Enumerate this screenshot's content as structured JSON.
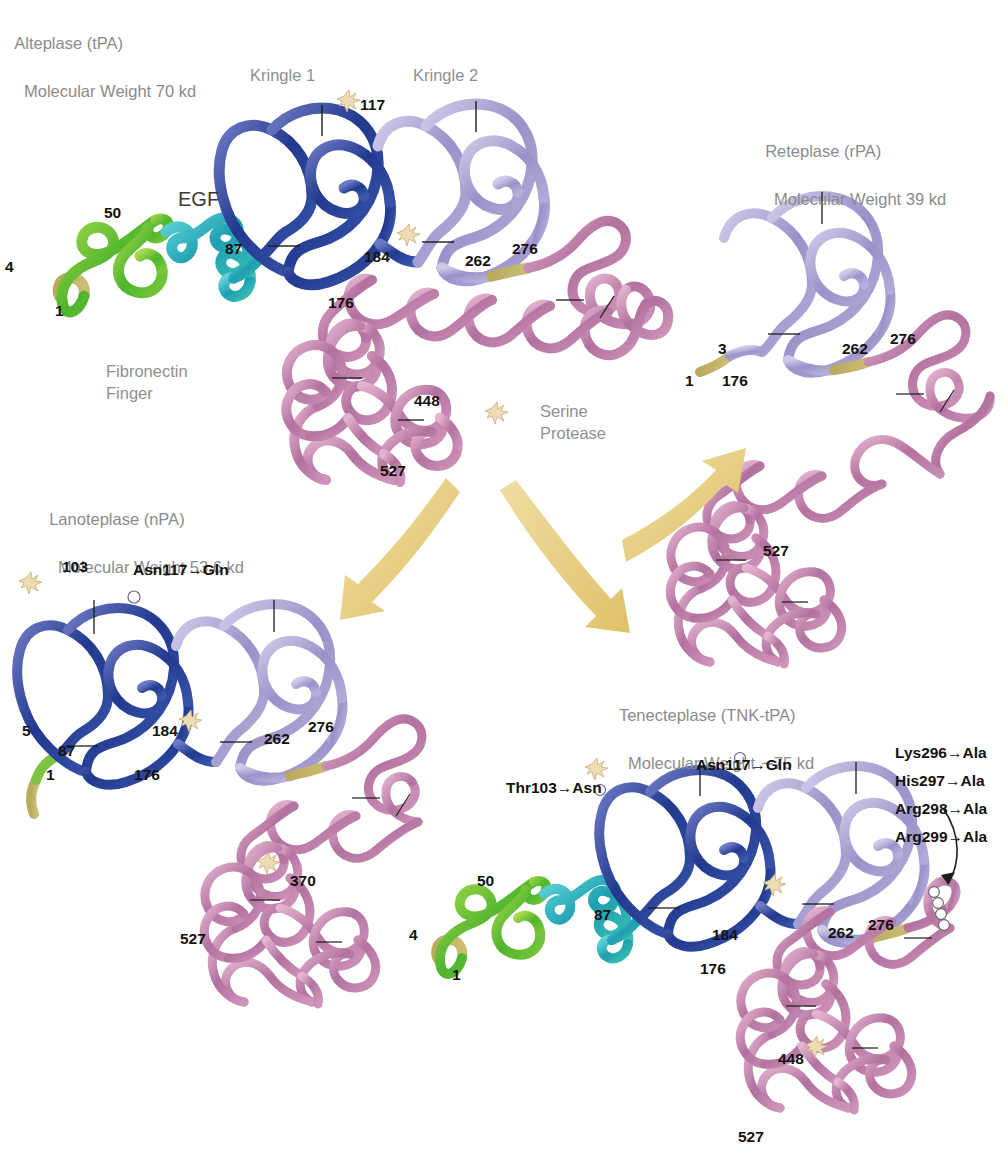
{
  "figure": {
    "type": "molecular-structure-diagram",
    "background_color": "#ffffff"
  },
  "palette": {
    "fibronectin_finger": "#62b838",
    "egf": "#28b0bd",
    "kringle1": "#2a4a9c",
    "kringle2": "#a9a0d2",
    "serine_protease": "#c88fb4",
    "linker_khaki": "#b9a martyr",
    "glycosylation": "#e8d2a8",
    "arrow": "#e9cf86",
    "title_text": "#8b8b8b",
    "label_text": "#15110f"
  },
  "panels": [
    {
      "id": "alteplase",
      "title_line1": "Alteplase (tPA)",
      "title_line2": "Molecular Weight 70 kd",
      "domain_labels": [
        {
          "name": "kringle1",
          "text": "Kringle 1"
        },
        {
          "name": "kringle2",
          "text": "Kringle 2"
        },
        {
          "name": "egf",
          "text": "EGF"
        },
        {
          "name": "fibronectin",
          "text": "Fibronectin\nFinger"
        },
        {
          "name": "serine-protease",
          "text": "Serine\nProtease"
        }
      ],
      "residues": [
        "1",
        "4",
        "50",
        "87",
        "117",
        "176",
        "184",
        "262",
        "276",
        "448",
        "527"
      ],
      "mutations": [],
      "glycosylation_sites": [
        "117",
        "184",
        "448"
      ]
    },
    {
      "id": "reteplase",
      "title_line1": "Reteplase (rPA)",
      "title_line2": "Molecular Weight 39 kd",
      "domain_labels": [],
      "residues": [
        "1",
        "3",
        "176",
        "262",
        "276",
        "527"
      ],
      "mutations": [],
      "glycosylation_sites": []
    },
    {
      "id": "lanoteplase",
      "title_line1": "Lanoteplase (nPA)",
      "title_line2": "Molecular Weight 53.6 kd",
      "domain_labels": [],
      "residues": [
        "1",
        "5",
        "87",
        "103",
        "176",
        "184",
        "262",
        "276",
        "370",
        "527"
      ],
      "mutations": [
        "Asn117→Gln"
      ],
      "glycosylation_sites": [
        "103",
        "184",
        "370"
      ]
    },
    {
      "id": "tenecteplase",
      "title_line1": "Tenecteplase (TNK-tPA)",
      "title_line2": "Molecular Weight ∼75 kd",
      "domain_labels": [],
      "residues": [
        "1",
        "4",
        "50",
        "87",
        "176",
        "184",
        "262",
        "276",
        "448",
        "527"
      ],
      "mutations": [
        "Thr103→Asn",
        "Asn117→Gln",
        "Lys296→Ala",
        "His297→Ala",
        "Arg298→Ala",
        "Arg299→Ala"
      ],
      "glycosylation_sites": [
        "103",
        "184",
        "448"
      ]
    }
  ],
  "arrows": [
    {
      "name": "arrow-to-reteplase",
      "from": "alteplase",
      "to": "reteplase"
    },
    {
      "name": "arrow-to-lanoteplase",
      "from": "alteplase",
      "to": "lanoteplase"
    },
    {
      "name": "arrow-to-tenecteplase",
      "from": "alteplase",
      "to": "tenecteplase"
    },
    {
      "name": "arrow-to-tnk-site",
      "from": "tnk-mutation-list",
      "to": "tenecteplase-296-299-site"
    }
  ],
  "alteplase": {
    "title1": "Alteplase (tPA)",
    "title2": "Molecular Weight 70 kd",
    "kringle1": "Kringle 1",
    "kringle2": "Kringle 2",
    "egf": "EGF",
    "fib1": "Fibronectin",
    "fib2": "Finger",
    "sp1": "Serine",
    "sp2": "Protease",
    "n1": "1",
    "n4": "4",
    "n50": "50",
    "n87": "87",
    "n117": "117",
    "n176": "176",
    "n184": "184",
    "n262": "262",
    "n276": "276",
    "n448": "448",
    "n527": "527"
  },
  "reteplase": {
    "title1": "Reteplase (rPA)",
    "title2": "Molecular Weight 39 kd",
    "n1": "1",
    "n3": "3",
    "n176": "176",
    "n262": "262",
    "n276": "276",
    "n527": "527"
  },
  "lanoteplase": {
    "title1": "Lanoteplase (nPA)",
    "title2": "Molecular Weight 53.6 kd",
    "mut117": "Asn117→Gln",
    "n1": "1",
    "n5": "5",
    "n87": "87",
    "n103": "103",
    "n176": "176",
    "n184": "184",
    "n262": "262",
    "n276": "276",
    "n370": "370",
    "n527": "527"
  },
  "tenecteplase": {
    "title1": "Tenecteplase (TNK-tPA)",
    "title2": "Molecular Weight ∼75 kd",
    "mut103": "Thr103→Asn",
    "mut117": "Asn117→Gln",
    "mut296": "Lys296→Ala",
    "mut297": "His297→Ala",
    "mut298": "Arg298→Ala",
    "mut299": "Arg299→Ala",
    "n1": "1",
    "n4": "4",
    "n50": "50",
    "n87": "87",
    "n176": "176",
    "n184": "184",
    "n262": "262",
    "n276": "276",
    "n448": "448",
    "n527": "527"
  }
}
